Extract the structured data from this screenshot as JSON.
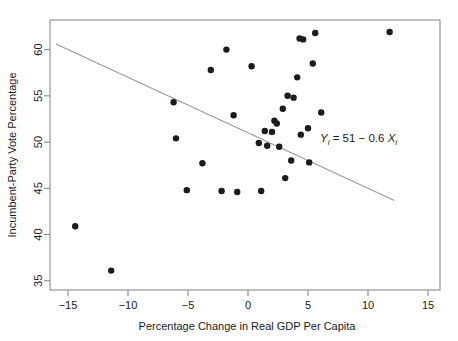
{
  "chart_data": {
    "type": "scatter",
    "title": "",
    "xlabel": "Percentage Change in Real GDP Per Capita",
    "ylabel": "Incumbent-Party Vote Percentage",
    "xlim": [
      -16.5,
      16.0
    ],
    "ylim": [
      34.0,
      63.2
    ],
    "xticks": [
      -15,
      -10,
      -5,
      0,
      5,
      10,
      15
    ],
    "xticklabels": [
      "−15",
      "−10",
      "−5",
      "0",
      "5",
      "10",
      "15"
    ],
    "yticks": [
      35,
      40,
      45,
      50,
      55,
      60
    ],
    "yticklabels": [
      "35",
      "40",
      "45",
      "50",
      "55",
      "60"
    ],
    "grid": false,
    "legend": null,
    "point_color": "#1c1c1c",
    "point_radius": 3.2,
    "line_color": "#9a9a9a",
    "axis_color": "#808080",
    "points": [
      {
        "x": -14.4,
        "y": 40.9
      },
      {
        "x": -11.4,
        "y": 36.1
      },
      {
        "x": -6.2,
        "y": 54.3
      },
      {
        "x": -6.0,
        "y": 50.4
      },
      {
        "x": -5.1,
        "y": 44.8
      },
      {
        "x": -3.8,
        "y": 47.7
      },
      {
        "x": -3.1,
        "y": 57.8
      },
      {
        "x": -2.2,
        "y": 44.7
      },
      {
        "x": -1.8,
        "y": 60.0
      },
      {
        "x": -1.2,
        "y": 52.9
      },
      {
        "x": -0.9,
        "y": 44.6
      },
      {
        "x": 0.3,
        "y": 58.2
      },
      {
        "x": 0.9,
        "y": 49.9
      },
      {
        "x": 1.1,
        "y": 44.7
      },
      {
        "x": 1.4,
        "y": 51.2
      },
      {
        "x": 1.6,
        "y": 49.6
      },
      {
        "x": 2.0,
        "y": 51.1
      },
      {
        "x": 2.2,
        "y": 52.3
      },
      {
        "x": 2.4,
        "y": 52.0
      },
      {
        "x": 2.6,
        "y": 49.5
      },
      {
        "x": 2.9,
        "y": 53.6
      },
      {
        "x": 3.1,
        "y": 46.1
      },
      {
        "x": 3.3,
        "y": 55.0
      },
      {
        "x": 3.6,
        "y": 48.0
      },
      {
        "x": 3.8,
        "y": 54.8
      },
      {
        "x": 4.1,
        "y": 57.0
      },
      {
        "x": 4.3,
        "y": 61.2
      },
      {
        "x": 4.4,
        "y": 50.8
      },
      {
        "x": 4.6,
        "y": 61.1
      },
      {
        "x": 5.0,
        "y": 51.5
      },
      {
        "x": 5.1,
        "y": 47.8
      },
      {
        "x": 5.4,
        "y": 58.5
      },
      {
        "x": 5.6,
        "y": 61.8
      },
      {
        "x": 6.1,
        "y": 53.2
      },
      {
        "x": 11.8,
        "y": 61.9
      }
    ],
    "fit_line": {
      "intercept": 51.0,
      "slope": -0.6,
      "x_start": -16.0,
      "x_end": 12.2
    },
    "annotation": {
      "parts": [
        "Y",
        "i",
        " = 51 − 0.6 ",
        "X",
        "i"
      ],
      "text": "Yi = 51 − 0.6 Xi",
      "x": 6.0,
      "y": 50.0
    }
  }
}
